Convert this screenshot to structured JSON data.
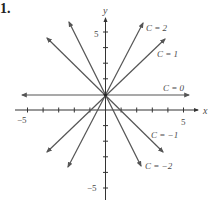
{
  "problem_number": "1.",
  "axes": {
    "x_label": "x",
    "y_label": "y",
    "x_tick_labels": {
      "neg": "−5",
      "pos": "5"
    },
    "y_tick_labels": {
      "neg": "−5",
      "pos": "5"
    },
    "xlim": [
      -6,
      6
    ],
    "ylim": [
      -6,
      6
    ]
  },
  "curves": [
    {
      "label": "C = 2",
      "slope": 2,
      "intercept": 1
    },
    {
      "label": "C = 1",
      "slope": 1,
      "intercept": 1
    },
    {
      "label": "C = 0",
      "slope": 0,
      "intercept": 1
    },
    {
      "label": "C = −1",
      "slope": -1,
      "intercept": 1
    },
    {
      "label": "C = −2",
      "slope": -2,
      "intercept": 1
    }
  ],
  "colors": {
    "line": "#555555",
    "axis": "#333333",
    "text": "#4a4a4a"
  }
}
